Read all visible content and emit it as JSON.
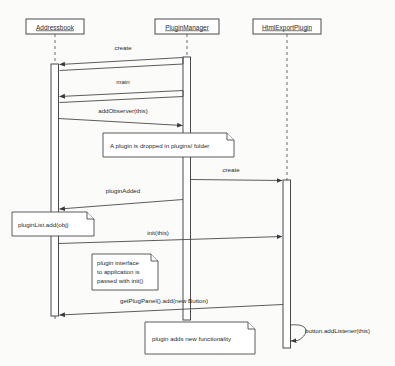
{
  "diagram": {
    "type": "uml-sequence-diagram",
    "background_color": "#fbfbfa",
    "line_color": "#4a4a4a",
    "text_color": "#2a2a2a"
  },
  "participants": [
    {
      "id": "addressbook",
      "label": "Addressbook",
      "x": 55,
      "box": {
        "x": 26,
        "y": 19,
        "w": 58,
        "h": 15
      }
    },
    {
      "id": "pluginmanager",
      "label": "PluginManager",
      "x": 187,
      "box": {
        "x": 155,
        "y": 19,
        "w": 64,
        "h": 15
      }
    },
    {
      "id": "htmlexportplugin",
      "label": "HtmlExportPlugin",
      "x": 287,
      "box": {
        "x": 253,
        "y": 19,
        "w": 68,
        "h": 15
      }
    }
  ],
  "messages": [
    {
      "id": "create",
      "label": "create",
      "from": "pluginmanager",
      "to": "addressbook",
      "label_x": 123,
      "label_y": 50
    },
    {
      "id": "main",
      "label": "main",
      "from": "pluginmanager",
      "to": "addressbook",
      "label_x": 123,
      "label_y": 84
    },
    {
      "id": "addobserver",
      "label": "addObserver(this)",
      "from": "addressbook",
      "to": "pluginmanager",
      "label_x": 123,
      "label_y": 113
    },
    {
      "id": "create2",
      "label": "create",
      "from": "pluginmanager",
      "to": "htmlexportplugin",
      "label_x": 228,
      "label_y": 172
    },
    {
      "id": "pluginadded",
      "label": "pluginAdded",
      "from": "pluginmanager",
      "to": "addressbook",
      "label_x": 123,
      "label_y": 193
    },
    {
      "id": "init",
      "label": "init(this)",
      "from": "addressbook",
      "to": "htmlexportplugin",
      "label_x": 158,
      "label_y": 235
    },
    {
      "id": "getplugpanel",
      "label": "getPlugPanel().add(new Button)",
      "from": "htmlexportplugin",
      "to": "addressbook",
      "label_x": 164,
      "label_y": 303
    },
    {
      "id": "addlistener",
      "label": "button.addListener(this)",
      "from": "htmlexportplugin",
      "to": "htmlexportplugin",
      "label_x": 310,
      "label_y": 330
    }
  ],
  "notes": [
    {
      "id": "note-plugin-dropped",
      "lines": [
        "A plugin is dropped in plugins/ folder"
      ],
      "box": {
        "x": 103,
        "y": 133,
        "w": 131,
        "h": 24
      }
    },
    {
      "id": "note-pluginlist-add",
      "lines": [
        "pluginList.add(obj)"
      ],
      "box": {
        "x": 12,
        "y": 212,
        "w": 82,
        "h": 24
      }
    },
    {
      "id": "note-plugin-interface",
      "lines": [
        "plugin interface",
        "to application is",
        "passed with init()"
      ],
      "box": {
        "x": 92,
        "y": 254,
        "w": 66,
        "h": 36
      }
    },
    {
      "id": "note-new-functionality",
      "lines": [
        "plugin adds new functionality"
      ],
      "box": {
        "x": 145,
        "y": 322,
        "w": 110,
        "h": 32
      }
    }
  ],
  "callout": {
    "id": "callout-addlistener",
    "label": "button.addListener(this)"
  }
}
